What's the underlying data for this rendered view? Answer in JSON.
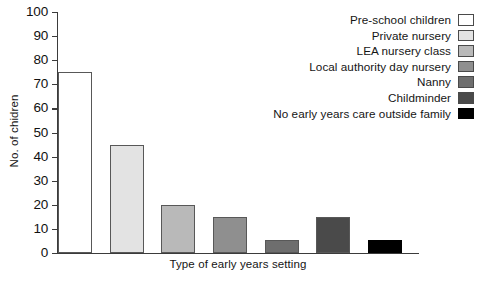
{
  "chart_data": {
    "type": "bar",
    "title": "",
    "subtitle": "",
    "xlabel": "Type of early years setting",
    "ylabel": "No. of chidren",
    "ylim": [
      0,
      100
    ],
    "ytick_step": 10,
    "yticks": [
      "100",
      "90",
      "80",
      "70",
      "60",
      "50",
      "40",
      "30",
      "20",
      "10",
      "0"
    ],
    "grid": false,
    "legend_position": "top-right",
    "categories": [
      "Pre-school children",
      "Private nursery",
      "LEA nursery class",
      "Local authority day nursery",
      "Nanny",
      "Childminder",
      "No early years care outside family"
    ],
    "values": [
      75,
      45,
      20,
      15,
      5.5,
      15,
      5.5
    ],
    "colors": [
      "#ffffff",
      "#e3e3e3",
      "#b9b9b9",
      "#8f8f8f",
      "#6e6e6e",
      "#4a4a4a",
      "#000000"
    ]
  },
  "axis": {
    "y_title": "No. of chidren",
    "x_title": "Type of early years setting"
  },
  "legend": {
    "items": [
      {
        "label": "Pre-school children",
        "color": "#ffffff"
      },
      {
        "label": "Private nursery",
        "color": "#e3e3e3"
      },
      {
        "label": "LEA nursery class",
        "color": "#b9b9b9"
      },
      {
        "label": "Local authority day nursery",
        "color": "#8f8f8f"
      },
      {
        "label": "Nanny",
        "color": "#6e6e6e"
      },
      {
        "label": "Childminder",
        "color": "#4a4a4a"
      },
      {
        "label": "No early years care outside family",
        "color": "#000000"
      }
    ]
  }
}
